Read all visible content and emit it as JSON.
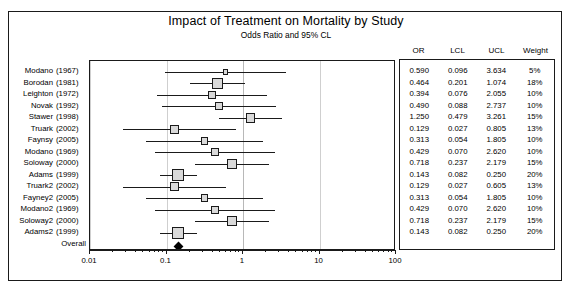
{
  "header": {
    "title": "Impact of Treatment on Mortality by Study",
    "subtitle": "Odds Ratio and 95% CL"
  },
  "table": {
    "columns": [
      "OR",
      "LCL",
      "UCL",
      "Weight"
    ]
  },
  "axis": {
    "ticks": [
      "0.01",
      "0.1",
      "1",
      "10",
      "100"
    ],
    "favors_left": "Favors Treatment",
    "favors_right": "Favors Placebo"
  },
  "colors": {
    "marker_fill": "#d9d9d9",
    "marker_border": "#1a1a1a",
    "line": "#1a1a1a",
    "gridline": "#cfcfcf",
    "diamond": "#000000"
  },
  "chart_data": {
    "type": "forest",
    "title": "Impact of Treatment on Mortality by Study",
    "subtitle": "Odds Ratio and 95% CL",
    "xlabel": "",
    "ylabel": "",
    "xscale": "log",
    "xlim": [
      0.01,
      100
    ],
    "xticks": [
      0.01,
      0.1,
      1,
      10,
      100
    ],
    "reference_line": 1,
    "grid": true,
    "legend": "none",
    "columns": [
      "OR",
      "LCL",
      "UCL",
      "Weight"
    ],
    "studies": [
      {
        "name": "Modano",
        "year": "(1967)",
        "or": 0.59,
        "lcl": 0.096,
        "ucl": 3.634,
        "weight": "5%",
        "weight_value": 5
      },
      {
        "name": "Borodan",
        "year": "(1981)",
        "or": 0.464,
        "lcl": 0.201,
        "ucl": 1.074,
        "weight": "18%",
        "weight_value": 18
      },
      {
        "name": "Leighton",
        "year": "(1972)",
        "or": 0.394,
        "lcl": 0.076,
        "ucl": 2.055,
        "weight": "10%",
        "weight_value": 10
      },
      {
        "name": "Novak",
        "year": "(1992)",
        "or": 0.49,
        "lcl": 0.088,
        "ucl": 2.737,
        "weight": "10%",
        "weight_value": 10
      },
      {
        "name": "Stawer",
        "year": "(1998)",
        "or": 1.25,
        "lcl": 0.479,
        "ucl": 3.261,
        "weight": "15%",
        "weight_value": 15
      },
      {
        "name": "Truark",
        "year": "(2002)",
        "or": 0.129,
        "lcl": 0.027,
        "ucl": 0.805,
        "weight": "13%",
        "weight_value": 13
      },
      {
        "name": "Faynsy",
        "year": "(2005)",
        "or": 0.313,
        "lcl": 0.054,
        "ucl": 1.805,
        "weight": "10%",
        "weight_value": 10
      },
      {
        "name": "Modano",
        "year": "(1969)",
        "or": 0.429,
        "lcl": 0.07,
        "ucl": 2.62,
        "weight": "10%",
        "weight_value": 10
      },
      {
        "name": "Soloway",
        "year": "(2000)",
        "or": 0.718,
        "lcl": 0.237,
        "ucl": 2.179,
        "weight": "15%",
        "weight_value": 15
      },
      {
        "name": "Adams",
        "year": "(1999)",
        "or": 0.143,
        "lcl": 0.082,
        "ucl": 0.25,
        "weight": "20%",
        "weight_value": 20
      },
      {
        "name": "Truark2",
        "year": "(2002)",
        "or": 0.129,
        "lcl": 0.027,
        "ucl": 0.605,
        "weight": "13%",
        "weight_value": 13
      },
      {
        "name": "Fayney2",
        "year": "(2005)",
        "or": 0.313,
        "lcl": 0.054,
        "ucl": 1.805,
        "weight": "10%",
        "weight_value": 10
      },
      {
        "name": "Modano2",
        "year": "(1969)",
        "or": 0.429,
        "lcl": 0.07,
        "ucl": 2.62,
        "weight": "10%",
        "weight_value": 10
      },
      {
        "name": "Soloway2",
        "year": "(2000)",
        "or": 0.718,
        "lcl": 0.237,
        "ucl": 2.179,
        "weight": "15%",
        "weight_value": 15
      },
      {
        "name": "Adams2",
        "year": "(1999)",
        "or": 0.143,
        "lcl": 0.082,
        "ucl": 0.25,
        "weight": "20%",
        "weight_value": 20
      }
    ],
    "overall": {
      "label": "Overall",
      "or": 0.143,
      "lcl": 0.082,
      "ucl": 0.25
    }
  }
}
